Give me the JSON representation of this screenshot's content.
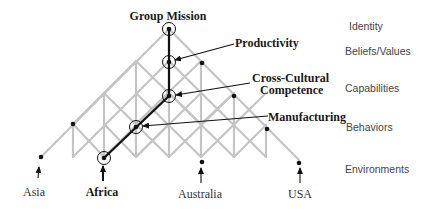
{
  "diagram": {
    "title": "Group Mission",
    "levels": [
      {
        "label": "Identity",
        "y": 29
      },
      {
        "label": "Beliefs/Values",
        "y": 55
      },
      {
        "label": "Capabilities",
        "y": 89
      },
      {
        "label": "Behaviors",
        "y": 128
      },
      {
        "label": "Environments",
        "y": 170
      }
    ],
    "path_nodes": [
      {
        "label": "Group Mission",
        "level": "Identity"
      },
      {
        "label": "Productivity",
        "level": "Beliefs/Values"
      },
      {
        "label": "Cross-Cultural Competence",
        "level": "Capabilities",
        "lines": [
          "Cross-Cultural",
          "Competence"
        ]
      },
      {
        "label": "Manufacturing",
        "level": "Behaviors"
      },
      {
        "label": "Africa",
        "level": "Environments"
      }
    ],
    "environments": [
      {
        "label": "Asia",
        "bold": false
      },
      {
        "label": "Africa",
        "bold": true
      },
      {
        "label": "Australia",
        "bold": false
      },
      {
        "label": "USA",
        "bold": false
      }
    ],
    "colors": {
      "lattice": "#c4c4c4",
      "path": "#111111",
      "node": "#111111",
      "text": "#1a1a1a",
      "level_text": "#444444"
    }
  }
}
